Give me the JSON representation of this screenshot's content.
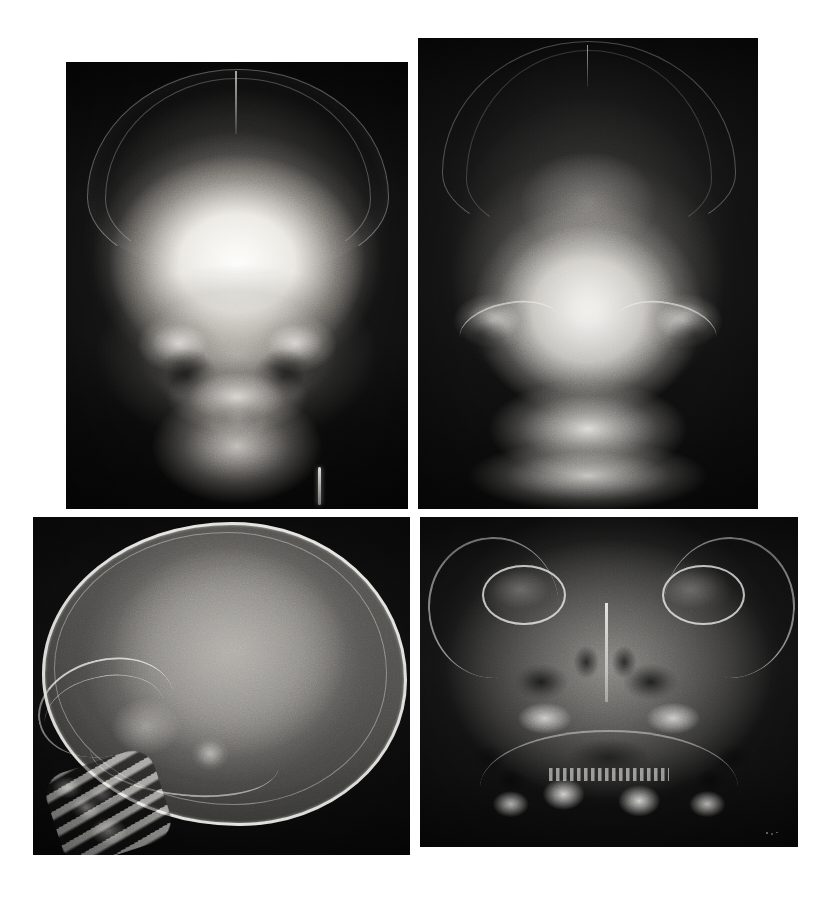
{
  "figure": {
    "background_color": "#ffffff",
    "width": 830,
    "height": 905,
    "panel_count": 4,
    "layout": "2x2 irregular grid of scanned radiographic films",
    "modality": "Plain film radiography (X-ray)",
    "anatomy": "Skull / craniofacial"
  },
  "panels": [
    {
      "id": "panel-ap",
      "data_name": "xray-panel-ap-skull",
      "position_label": "top-left",
      "view": "AP (anteroposterior) skull",
      "caption": "",
      "frame": {
        "x": 66,
        "y": 62,
        "width": 342,
        "height": 447
      },
      "film_base_color": "#101010",
      "features": [
        "calvarial vault with bright cortical outline",
        "midline metopic/sagittal suture at vertex",
        "bilateral orbits",
        "nasal cavity and turbinates",
        "maxilla and mandible",
        "radiopaque metallic marker at lower right of film"
      ]
    },
    {
      "id": "panel-townes",
      "data_name": "xray-panel-townes-view",
      "position_label": "top-right",
      "view": "Towne's (occipital) projection",
      "caption": "",
      "frame": {
        "x": 418,
        "y": 38,
        "width": 340,
        "height": 471
      },
      "film_base_color": "#121212",
      "features": [
        "occipital bone and enlarged cranial vault",
        "midline sagittal suture",
        "bilateral petrous ridges",
        "foramen magnum region",
        "cervical spine shadow inferiorly"
      ]
    },
    {
      "id": "panel-lateral",
      "data_name": "xray-panel-lateral-skull",
      "position_label": "bottom-left",
      "view": "Lateral skull",
      "caption": "",
      "frame": {
        "x": 33,
        "y": 517,
        "width": 377,
        "height": 338
      },
      "film_base_color": "#0d0d0d",
      "features": [
        "large rounded calvarium with sharply defined cortical table",
        "thin calvarial bone with prominent inner/outer table",
        "sella turcica and skull base",
        "facial bones anteriorly",
        "cervical vertebrae with developing ossification"
      ]
    },
    {
      "id": "panel-waters",
      "data_name": "xray-panel-waters-view",
      "position_label": "bottom-right",
      "view": "Waters (occipitomental) projection",
      "caption": "",
      "frame": {
        "x": 420,
        "y": 517,
        "width": 378,
        "height": 330
      },
      "film_base_color": "#141414",
      "features": [
        "bilateral orbital rims clearly outlined",
        "maxillary sinuses (radiolucent, dark)",
        "nasal septum and nasal cavity midline",
        "zygomatic arches bilaterally",
        "maxillary and mandibular developing dentition",
        "small bright artefact specks at lower right of film"
      ]
    }
  ],
  "colors": {
    "page_background": "#ffffff",
    "film_dark": "#0a0a0a",
    "bone_bright": "#fbfaf6",
    "soft_tissue_mid": "#8e8c87",
    "air_space_dark": "#0e0e0e"
  }
}
